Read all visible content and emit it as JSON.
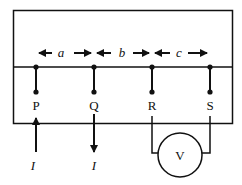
{
  "diagram": {
    "type": "four-probe-measurement",
    "probes": [
      {
        "label": "P",
        "x": 36
      },
      {
        "label": "Q",
        "x": 94
      },
      {
        "label": "R",
        "x": 152
      },
      {
        "label": "S",
        "x": 210
      }
    ],
    "spacings": [
      {
        "label": "a",
        "from": "P",
        "to": "Q"
      },
      {
        "label": "b",
        "from": "Q",
        "to": "R"
      },
      {
        "label": "c",
        "from": "R",
        "to": "S"
      }
    ],
    "current": {
      "in_label": "I",
      "out_label": "I",
      "in_probe": "P",
      "out_probe": "Q"
    },
    "voltmeter": {
      "label": "V",
      "between": [
        "R",
        "S"
      ]
    },
    "colors": {
      "line": "#111111",
      "background": "#ffffff"
    }
  }
}
